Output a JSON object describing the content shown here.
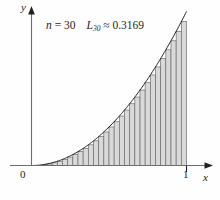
{
  "figure": {
    "name": "left-riemann-sum-figure",
    "background_color": "#fefefe"
  },
  "annotation": {
    "n_symbol": "n",
    "n_equals": " = ",
    "n_value": "30",
    "L_symbol": "L",
    "L_subscript": "30",
    "approx_sign": " ≈ ",
    "L_value": "0.3169",
    "full_text": "n = 30   L₃₀ ≈ 0.3169"
  },
  "axes": {
    "x_label": "x",
    "y_label": "y",
    "origin_label": "0",
    "x_tick_label": "1",
    "axis_color": "#6d6e71",
    "arrow_color": "#231f20"
  },
  "chart_data": {
    "type": "bar",
    "title": "",
    "subtitle": "",
    "xlabel": "x",
    "ylabel": "y",
    "xlim": [
      0,
      1.12
    ],
    "ylim": [
      0,
      1.08
    ],
    "grid": false,
    "legend": false,
    "n": 30,
    "riemann_sum_value": 0.3169,
    "rule": "left-endpoint",
    "function": "y = x^2",
    "bar_fill_color": "#d9d9d9",
    "bar_edge_color": "#6d6e71",
    "curve_color": "#231f20",
    "x": [
      0.0,
      0.0333333,
      0.0666667,
      0.1,
      0.1333333,
      0.1666667,
      0.2,
      0.2333333,
      0.2666667,
      0.3,
      0.3333333,
      0.3666667,
      0.4,
      0.4333333,
      0.4666667,
      0.5,
      0.5333333,
      0.5666667,
      0.6,
      0.6333333,
      0.6666667,
      0.7,
      0.7333333,
      0.7666667,
      0.8,
      0.8333333,
      0.8666667,
      0.9,
      0.9333333,
      0.9666667
    ],
    "values": [
      0.0,
      0.001111,
      0.004444,
      0.01,
      0.017778,
      0.027778,
      0.04,
      0.054444,
      0.071111,
      0.09,
      0.111111,
      0.134444,
      0.16,
      0.187778,
      0.217778,
      0.25,
      0.284444,
      0.321111,
      0.36,
      0.401111,
      0.444444,
      0.49,
      0.537778,
      0.587778,
      0.64,
      0.694444,
      0.751111,
      0.81,
      0.871111,
      0.934444
    ],
    "bar_width": 0.0333333,
    "curve_x": [
      0,
      0.05,
      0.1,
      0.15,
      0.2,
      0.25,
      0.3,
      0.35,
      0.4,
      0.45,
      0.5,
      0.55,
      0.6,
      0.65,
      0.7,
      0.75,
      0.8,
      0.85,
      0.9,
      0.95,
      1.0
    ],
    "curve_y": [
      0,
      0.0025,
      0.01,
      0.0225,
      0.04,
      0.0625,
      0.09,
      0.1225,
      0.16,
      0.2025,
      0.25,
      0.3025,
      0.36,
      0.4225,
      0.49,
      0.5625,
      0.64,
      0.7225,
      0.81,
      0.9025,
      1.0
    ]
  }
}
